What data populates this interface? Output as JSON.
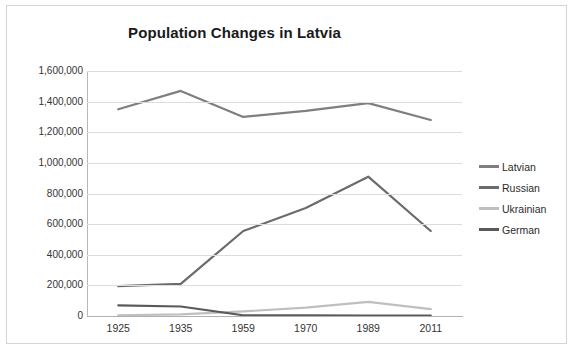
{
  "chart_data": {
    "type": "line",
    "title": "Population Changes in Latvia",
    "xlabel": "",
    "ylabel": "",
    "categories": [
      "1925",
      "1935",
      "1959",
      "1970",
      "1989",
      "2011"
    ],
    "ylim": [
      0,
      1600000
    ],
    "ytick_labels": [
      "1,600,000",
      "1,400,000",
      "1,200,000",
      "1,000,000",
      "800,000",
      "600,000",
      "400,000",
      "200,000",
      "0"
    ],
    "ytick_values": [
      1600000,
      1400000,
      1200000,
      1000000,
      800000,
      600000,
      400000,
      200000,
      0
    ],
    "grid": true,
    "legend_position": "right",
    "series": [
      {
        "name": "Latvian",
        "color": "#7f7f7f",
        "values": [
          1350000,
          1470000,
          1300000,
          1340000,
          1390000,
          1280000
        ]
      },
      {
        "name": "Russian",
        "color": "#6b6b6b",
        "values": [
          195000,
          210000,
          555000,
          705000,
          910000,
          555000
        ]
      },
      {
        "name": "Ukrainian",
        "color": "#bfbfbf",
        "values": [
          5000,
          10000,
          30000,
          55000,
          92000,
          45000
        ]
      },
      {
        "name": "German",
        "color": "#5a5a5a",
        "values": [
          70000,
          62000,
          5000,
          5000,
          3000,
          3000
        ]
      }
    ]
  },
  "colors": {
    "frame_border": "#d4d4d4",
    "gridline": "#dcdcdc",
    "axis": "#b0b0b0",
    "title_text": "#1a1a1a",
    "tick_text": "#333333"
  }
}
